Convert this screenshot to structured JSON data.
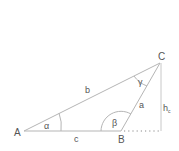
{
  "diagram": {
    "vertices": {
      "A": {
        "label": "A",
        "x": 24,
        "y": 131
      },
      "B": {
        "label": "B",
        "x": 121,
        "y": 131
      },
      "C": {
        "label": "C",
        "x": 160,
        "y": 63
      },
      "H": {
        "x": 161,
        "y": 131
      }
    },
    "sides": {
      "a": {
        "label": "a"
      },
      "b": {
        "label": "b"
      },
      "c": {
        "label": "c"
      }
    },
    "angles": {
      "alpha": {
        "label": "α"
      },
      "beta": {
        "label": "β"
      },
      "gamma": {
        "label": "γ"
      }
    },
    "height": {
      "label": "h",
      "subscript": "c"
    },
    "colors": {
      "line": "#b5b5b5",
      "text": "#555555",
      "background": "#ffffff"
    }
  }
}
